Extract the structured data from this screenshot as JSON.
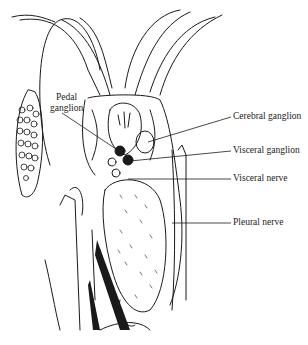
{
  "diagram": {
    "labels": [
      {
        "id": "pedal-ganglion",
        "lines": [
          "Pedal",
          "ganglion"
        ],
        "x": 52,
        "y": 93
      },
      {
        "id": "cerebral-ganglion",
        "text": "Cerebral ganglion",
        "x": 233,
        "y": 112
      },
      {
        "id": "visceral-ganglion",
        "text": "Visceral ganglion",
        "x": 233,
        "y": 146
      },
      {
        "id": "visceral-nerve",
        "text": "Visceral nerve",
        "x": 233,
        "y": 174
      },
      {
        "id": "pleural-nerve",
        "text": "Pleural nerve",
        "x": 233,
        "y": 218
      }
    ],
    "colors": {
      "ink": "#1a1a1a",
      "background": "#ffffff"
    }
  }
}
